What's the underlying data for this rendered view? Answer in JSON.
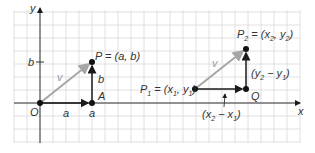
{
  "diagram": {
    "axes": {
      "x_label": "x",
      "y_label": "y",
      "origin_label": "O"
    },
    "left_figure": {
      "vector_label": "v",
      "point_P_label": "P = (a, b)",
      "point_A_label": "A",
      "horizontal_component_label": "a",
      "x_tick_label": "a",
      "vertical_component_label": "b",
      "y_tick_label": "b"
    },
    "right_figure": {
      "vector_label": "v",
      "point_P1": {
        "name": "P",
        "sub": "1",
        "rest": " = (x",
        "sub2": "1",
        "mid": ", y",
        "sub3": "1",
        "end": ")"
      },
      "point_P2": {
        "name": "P",
        "sub": "2",
        "rest": " = (x",
        "sub2": "2",
        "mid": ", y",
        "sub3": "2",
        "end": ")"
      },
      "point_Q_label": "Q",
      "vertical_component": {
        "open": "(y",
        "sub1": "2",
        "mid": " − y",
        "sub2": "1",
        "close": ")"
      },
      "horizontal_component": {
        "open": "(x",
        "sub1": "2",
        "mid": " − x",
        "sub2": "1",
        "close": ")"
      }
    },
    "colors": {
      "grid": "#d8d8d8",
      "axis": "#333333",
      "vector_v": "#a6a6a6",
      "component": "#1a1a1a"
    }
  }
}
